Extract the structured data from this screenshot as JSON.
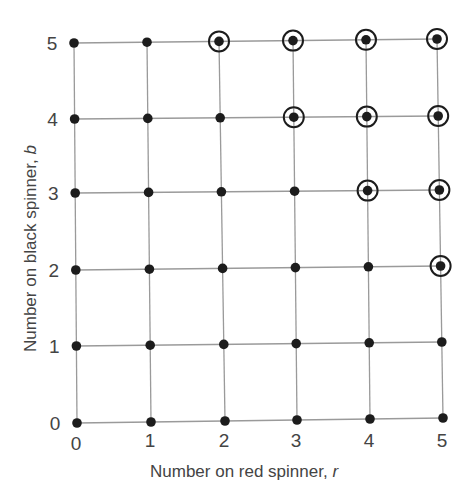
{
  "chart_data": {
    "type": "scatter",
    "title": "",
    "xlabel": "Number on red spinner, r",
    "ylabel": "Number on black spinner, b",
    "x_ticks": [
      "0",
      "1",
      "2",
      "3",
      "4",
      "5"
    ],
    "y_ticks": [
      "0",
      "1",
      "2",
      "3",
      "4",
      "5"
    ],
    "xlim": [
      0,
      5
    ],
    "ylim": [
      0,
      5
    ],
    "grid": true,
    "points_all": "every integer pair (r, b) with 0 ≤ r ≤ 5 and 0 ≤ b ≤ 5 (36 points)",
    "circled_points": [
      [
        2,
        5
      ],
      [
        3,
        5
      ],
      [
        4,
        5
      ],
      [
        5,
        5
      ],
      [
        3,
        4
      ],
      [
        4,
        4
      ],
      [
        5,
        4
      ],
      [
        4,
        3
      ],
      [
        5,
        3
      ],
      [
        5,
        2
      ]
    ],
    "circled_rule": "r + b >= 7"
  },
  "axes": {
    "x_label_text": "Number on red spinner, ",
    "x_label_var": "r",
    "y_label_text": "Number on black spinner, ",
    "y_label_var": "b"
  },
  "geometry": {
    "col_top_x": [
      74,
      147,
      219,
      293,
      366,
      437
    ],
    "col_bottom_x": [
      77,
      151,
      225,
      297,
      370,
      443
    ],
    "row_left_y": [
      423,
      346,
      270,
      193,
      119,
      43
    ],
    "row_right_y": [
      418,
      342,
      266,
      190,
      116,
      39
    ]
  },
  "style": {
    "dot_color": "#1c1c1c",
    "grid_color": "#9a9a9a",
    "text_color": "#444444"
  }
}
